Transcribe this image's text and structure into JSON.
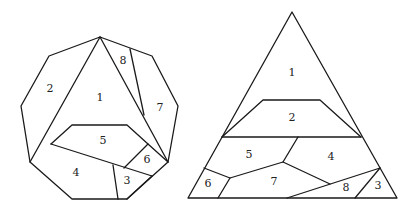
{
  "figure": {
    "stroke_color": "#1a1a1a",
    "background": "#ffffff",
    "nonagon": {
      "outline": [
        [
          100,
          37
        ],
        [
          152,
          56
        ],
        [
          178,
          106
        ],
        [
          168,
          162
        ],
        [
          127,
          199
        ],
        [
          72,
          199
        ],
        [
          30,
          162
        ],
        [
          21,
          106
        ],
        [
          49,
          56
        ]
      ],
      "cuts": [
        [
          [
            100,
            37
          ],
          [
            30,
            162
          ]
        ],
        [
          [
            100,
            37
          ],
          [
            168,
            162
          ]
        ],
        [
          [
            130,
            49
          ],
          [
            144,
            115
          ]
        ],
        [
          [
            51,
            144
          ],
          [
            72,
            125
          ],
          [
            127,
            125
          ],
          [
            148,
            144
          ],
          [
            168,
            162
          ]
        ],
        [
          [
            51,
            144
          ],
          [
            152,
            176
          ]
        ],
        [
          [
            148,
            144
          ],
          [
            124,
            168
          ]
        ],
        [
          [
            113,
            165
          ],
          [
            118,
            199
          ]
        ],
        [
          [
            152,
            176
          ],
          [
            127,
            199
          ]
        ]
      ],
      "labels": [
        {
          "text": "1",
          "x": 100,
          "y": 98
        },
        {
          "text": "2",
          "x": 50,
          "y": 89
        },
        {
          "text": "3",
          "x": 127,
          "y": 181
        },
        {
          "text": "4",
          "x": 76,
          "y": 173
        },
        {
          "text": "5",
          "x": 103,
          "y": 141
        },
        {
          "text": "6",
          "x": 147,
          "y": 160
        },
        {
          "text": "7",
          "x": 160,
          "y": 108
        },
        {
          "text": "8",
          "x": 123,
          "y": 61
        }
      ]
    },
    "triangle": {
      "outline": [
        [
          292,
          12
        ],
        [
          397,
          198
        ],
        [
          188,
          198
        ]
      ],
      "cuts": [
        [
          [
            222,
            137
          ],
          [
            361,
            137
          ]
        ],
        [
          [
            222,
            137
          ],
          [
            263,
            100
          ],
          [
            320,
            100
          ],
          [
            361,
            137
          ]
        ],
        [
          [
            298,
            137
          ],
          [
            283,
            162
          ]
        ],
        [
          [
            204,
            168
          ],
          [
            230,
            178
          ],
          [
            283,
            162
          ],
          [
            330,
            184
          ]
        ],
        [
          [
            230,
            178
          ],
          [
            218,
            198
          ]
        ],
        [
          [
            287,
            198
          ],
          [
            380,
            168
          ]
        ],
        [
          [
            380,
            168
          ],
          [
            355,
            198
          ]
        ]
      ],
      "labels": [
        {
          "text": "1",
          "x": 292,
          "y": 73
        },
        {
          "text": "2",
          "x": 292,
          "y": 118
        },
        {
          "text": "3",
          "x": 378,
          "y": 186
        },
        {
          "text": "4",
          "x": 331,
          "y": 157
        },
        {
          "text": "5",
          "x": 249,
          "y": 155
        },
        {
          "text": "6",
          "x": 208,
          "y": 184
        },
        {
          "text": "7",
          "x": 274,
          "y": 182
        },
        {
          "text": "8",
          "x": 346,
          "y": 188
        }
      ]
    }
  }
}
